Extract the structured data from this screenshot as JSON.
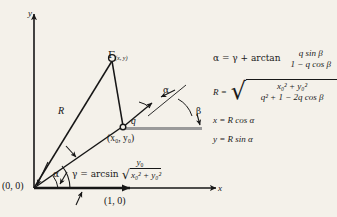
{
  "figure": {
    "kind": "geometry-diagram",
    "background_color": "#f4f1ea",
    "ink_color": "#161616",
    "accent_gray": "#9a9a9a",
    "axes": {
      "y_label": "y",
      "x_label": "x",
      "origin_label": "(0, 0)",
      "unit_point_label": "(1, 0)"
    },
    "points": {
      "apex_symbol": "Γ",
      "apex_subscript": "(x, y)",
      "inner_point_label": "(x₀, y₀)"
    },
    "segments": {
      "radius_label": "R",
      "ray_label": "q"
    },
    "angles": {
      "alpha_at_ray": "α",
      "beta_at_baseline": "β",
      "alpha_at_origin": "α"
    },
    "gamma_definition": {
      "lhs": "γ = arcsin",
      "numerator": "y",
      "numerator_sub": "0",
      "radicand_terms": "x₀² + y₀²"
    }
  },
  "equations": {
    "alpha": {
      "lhs": "α = γ + arctan",
      "numerator": "q sin β",
      "denominator": "1 − q cos β"
    },
    "R": {
      "lhs": "R =",
      "numerator": "x₀² + y₀²",
      "denominator": "q² + 1 − 2q cos β",
      "radical_sign": "√"
    },
    "x": {
      "text": "x = R cos α"
    },
    "y": {
      "text": "y = R sin α"
    }
  }
}
